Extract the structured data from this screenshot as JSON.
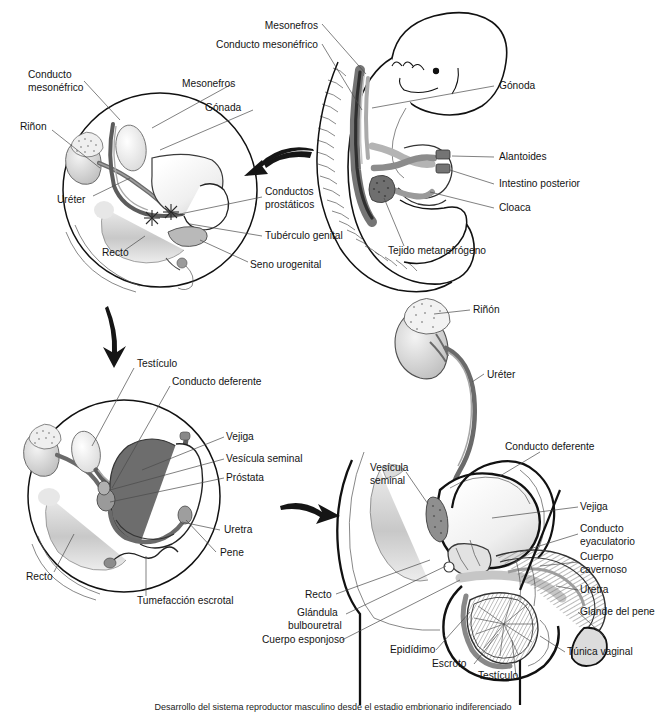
{
  "figure": {
    "title": "Desarrollo del sistema reproductor masculino",
    "caption": "Desarrollo del sistema reproductor masculino desde el estadio embrionario indiferenciado",
    "language": "es",
    "background": "#ffffff",
    "ink": "#111111",
    "palette": {
      "outline": "#111111",
      "lead_line": "#4a4a4a",
      "duct_dark": "#6e6e6e",
      "duct_mid": "#9a9a9a",
      "organ_light": "#e8e8e8",
      "organ_mid": "#c9c9c9",
      "organ_dark": "#8c8c8c",
      "shadow": "#d5d5d5",
      "arrow": "#1a1a1a"
    }
  },
  "panels": [
    {
      "id": "panel-a",
      "name": "embryonic-indifferent-pelvis",
      "position": "top-left",
      "labels": [
        {
          "key": "conducto-mesonefrico",
          "text": "Conducto\nmesonéfrico",
          "lines": [
            "Conducto",
            "mesonéfrico"
          ],
          "x": 28,
          "y": 75,
          "anchor": "start"
        },
        {
          "key": "rinon",
          "text": "Riñon",
          "lines": [
            "Riñon"
          ],
          "x": 20,
          "y": 127,
          "anchor": "start"
        },
        {
          "key": "ureter",
          "text": "Uréter",
          "lines": [
            "Uréter"
          ],
          "x": 57,
          "y": 200,
          "anchor": "start"
        },
        {
          "key": "recto",
          "text": "Recto",
          "lines": [
            "Recto"
          ],
          "x": 100,
          "y": 253,
          "anchor": "start"
        },
        {
          "key": "mesonefros",
          "text": "Mesonefros",
          "lines": [
            "Mesonefros"
          ],
          "x": 182,
          "y": 84,
          "anchor": "start"
        },
        {
          "key": "gonada",
          "text": "Gónada",
          "lines": [
            "Gónada"
          ],
          "x": 205,
          "y": 107,
          "anchor": "start"
        },
        {
          "key": "conductos-prostaticos",
          "text": "Conductos\nprostáticos",
          "lines": [
            "Conductos",
            "prostáticos"
          ],
          "x": 265,
          "y": 195,
          "anchor": "start"
        },
        {
          "key": "tuberculo-genital",
          "text": "Tubérculo genital",
          "lines": [
            "Tubérculo genital"
          ],
          "x": 265,
          "y": 236,
          "anchor": "start"
        },
        {
          "key": "seno-urogenital",
          "text": "Seno urogenital",
          "lines": [
            "Seno urogenital"
          ],
          "x": 250,
          "y": 265,
          "anchor": "start"
        }
      ]
    },
    {
      "id": "panel-b",
      "name": "embryo-whole-body",
      "position": "top-right",
      "labels": [
        {
          "key": "mesonefros",
          "text": "Mesonefros",
          "lines": [
            "Mesonefros"
          ],
          "x": 318,
          "y": 26,
          "anchor": "end"
        },
        {
          "key": "conducto-mesonefrico",
          "text": "Conducto mesonéfrico",
          "lines": [
            "Conducto mesonéfrico"
          ],
          "x": 318,
          "y": 45,
          "anchor": "end"
        },
        {
          "key": "gonoda",
          "text": "Gónoda",
          "lines": [
            "Gónoda"
          ],
          "x": 497,
          "y": 86,
          "anchor": "start"
        },
        {
          "key": "alantoides",
          "text": "Alantoides",
          "lines": [
            "Alantoides"
          ],
          "x": 497,
          "y": 157,
          "anchor": "start"
        },
        {
          "key": "intestino-posterior",
          "text": "Intestino posterior",
          "lines": [
            "Intestino posterior"
          ],
          "x": 497,
          "y": 184,
          "anchor": "start"
        },
        {
          "key": "cloaca",
          "text": "Cloaca",
          "lines": [
            "Cloaca"
          ],
          "x": 497,
          "y": 208,
          "anchor": "start"
        },
        {
          "key": "tejido-metanefrogeno",
          "text": "Tejido metanefrógeno",
          "lines": [
            "Tejido metanefrógeno"
          ],
          "x": 388,
          "y": 251,
          "anchor": "start"
        }
      ]
    },
    {
      "id": "panel-c",
      "name": "fetal-differentiated-pelvis",
      "position": "bottom-left",
      "labels": [
        {
          "key": "testiculo",
          "text": "Testículo",
          "lines": [
            "Testículo"
          ],
          "x": 137,
          "y": 364,
          "anchor": "start"
        },
        {
          "key": "conducto-deferente",
          "text": "Conducto deferente",
          "lines": [
            "Conducto deferente"
          ],
          "x": 172,
          "y": 382,
          "anchor": "start"
        },
        {
          "key": "vejiga",
          "text": "Vejiga",
          "lines": [
            "Vejiga"
          ],
          "x": 226,
          "y": 437,
          "anchor": "start"
        },
        {
          "key": "vesicula-seminal",
          "text": "Vesícula seminal",
          "lines": [
            "Vesícula seminal"
          ],
          "x": 226,
          "y": 459,
          "anchor": "start"
        },
        {
          "key": "prostata",
          "text": "Próstata",
          "lines": [
            "Próstata"
          ],
          "x": 226,
          "y": 478,
          "anchor": "start"
        },
        {
          "key": "uretra",
          "text": "Uretra",
          "lines": [
            "Uretra"
          ],
          "x": 222,
          "y": 530,
          "anchor": "start"
        },
        {
          "key": "pene",
          "text": "Pene",
          "lines": [
            "Pene"
          ],
          "x": 218,
          "y": 553,
          "anchor": "start"
        },
        {
          "key": "recto",
          "text": "Recto",
          "lines": [
            "Recto"
          ],
          "x": 26,
          "y": 577,
          "anchor": "start"
        },
        {
          "key": "tumefaccion-escrotal",
          "text": "Tumefacción escrotal",
          "lines": [
            "Tumefacción escrotal"
          ],
          "x": 137,
          "y": 601,
          "anchor": "start"
        }
      ]
    },
    {
      "id": "panel-d",
      "name": "adult-male-reproductive-sagittal",
      "position": "bottom-right",
      "labels": [
        {
          "key": "rinon",
          "text": "Riñón",
          "lines": [
            "Riñón"
          ],
          "x": 473,
          "y": 310,
          "anchor": "start"
        },
        {
          "key": "ureter",
          "text": "Uréter",
          "lines": [
            "Uréter"
          ],
          "x": 487,
          "y": 375,
          "anchor": "start"
        },
        {
          "key": "conducto-deferente",
          "text": "Conducto deferente",
          "lines": [
            "Conducto deferente"
          ],
          "x": 505,
          "y": 447,
          "anchor": "start"
        },
        {
          "key": "vesicula-seminal",
          "text": "Vesícula\nseminal",
          "lines": [
            "Vesícula",
            "seminal"
          ],
          "x": 370,
          "y": 468,
          "anchor": "start"
        },
        {
          "key": "vejiga",
          "text": "Vejiga",
          "lines": [
            "Vejiga"
          ],
          "x": 580,
          "y": 507,
          "anchor": "start"
        },
        {
          "key": "conducto-eyaculatorio",
          "text": "Conducto\neyaculatorio",
          "lines": [
            "Conducto",
            "eyaculatorio"
          ],
          "x": 580,
          "y": 530,
          "anchor": "start"
        },
        {
          "key": "cuerpo-cavernoso",
          "text": "Cuerpo\ncavernoso",
          "lines": [
            "Cuerpo",
            "cavernoso"
          ],
          "x": 580,
          "y": 558,
          "anchor": "start"
        },
        {
          "key": "uretra",
          "text": "Uretra",
          "lines": [
            "Uretra"
          ],
          "x": 580,
          "y": 590,
          "anchor": "start"
        },
        {
          "key": "glande-del-pene",
          "text": "Glande del pene",
          "lines": [
            "Glande del pene"
          ],
          "x": 580,
          "y": 612,
          "anchor": "start"
        },
        {
          "key": "tunica-vaginal",
          "text": "Túnica vaginal",
          "lines": [
            "Túnica vaginal"
          ],
          "x": 567,
          "y": 652,
          "anchor": "start"
        },
        {
          "key": "recto",
          "text": "Recto",
          "lines": [
            "Recto"
          ],
          "x": 305,
          "y": 595,
          "anchor": "start"
        },
        {
          "key": "glandula-bulbouretral",
          "text": "Glándula\nbulbouretral",
          "lines": [
            "Glándula",
            "bulbouretral"
          ],
          "x": 297,
          "y": 613,
          "anchor": "start"
        },
        {
          "key": "cuerpo-esponjoso",
          "text": "Cuerpo esponjoso",
          "lines": [
            "Cuerpo esponjoso"
          ],
          "x": 262,
          "y": 640,
          "anchor": "start"
        },
        {
          "key": "epididimo",
          "text": "Epidídimo",
          "lines": [
            "Epidídimo"
          ],
          "x": 390,
          "y": 650,
          "anchor": "start"
        },
        {
          "key": "escroto",
          "text": "Escroto",
          "lines": [
            "Escroto"
          ],
          "x": 432,
          "y": 664,
          "anchor": "start"
        },
        {
          "key": "testiculo",
          "text": "Testículo",
          "lines": [
            "Testículo"
          ],
          "x": 478,
          "y": 676,
          "anchor": "start"
        }
      ]
    }
  ],
  "arrows": [
    {
      "key": "arrow-a-to-b",
      "name": "arrow-embryo-to-pelvis",
      "direction": "left",
      "from": "panel-b",
      "to": "panel-a"
    },
    {
      "key": "arrow-a-to-c",
      "name": "arrow-down-development",
      "direction": "down",
      "from": "panel-a",
      "to": "panel-c"
    },
    {
      "key": "arrow-c-to-d",
      "name": "arrow-right-maturation",
      "direction": "right",
      "from": "panel-c",
      "to": "panel-d"
    }
  ]
}
